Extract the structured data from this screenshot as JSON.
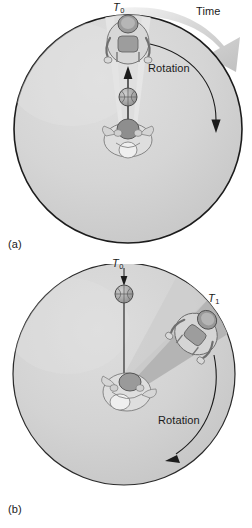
{
  "figure": {
    "caption_a": "(a)",
    "caption_b": "(b)",
    "colors": {
      "disk_fill": "#d2d2d2",
      "disk_edge": "#1c1c1c",
      "wedge_light": "#e3e3e3",
      "wedge_dark": "#b4b4b4",
      "time_arrow": "#c9c9c9",
      "background": "#ffffff",
      "text": "#1a1a1a"
    }
  },
  "panel_a": {
    "label": "(a)",
    "time_label": "Time",
    "rotation_label": "Rotation",
    "t0_label": "T",
    "t0_sub": "0",
    "icons": {
      "thrower": "person-center-throwing-icon",
      "catcher": "person-rim-catching-icon",
      "ball": "basketball-icon",
      "ball_path": "ball-path-arrow-icon",
      "rotation_arc": "rotation-arc-arrow-icon",
      "time_arc": "time-arc-arrow-icon",
      "disk": "rotating-disk-icon",
      "wedge": "light-wedge-sector-icon"
    },
    "geometry": {
      "disk_center_x": 128,
      "disk_center_y": 129,
      "disk_radius": 115,
      "wedge_start_deg": 262,
      "wedge_end_deg": 278
    }
  },
  "panel_b": {
    "label": "(b)",
    "rotation_label": "Rotation",
    "t0_label": "T",
    "t0_sub": "0",
    "t1_label": "T",
    "t1_sub": "1",
    "icons": {
      "thrower": "person-center-throwing-icon",
      "catcher": "person-rim-displaced-icon",
      "ball": "basketball-icon",
      "ball_path": "ball-path-line-icon",
      "rotation_arc": "rotation-arc-arrow-icon",
      "disk": "rotating-disk-icon",
      "wedge_dark": "dark-wedge-sector-icon",
      "wedge_light": "light-wedge-sector-icon"
    },
    "geometry": {
      "disk_center_x": 124,
      "disk_center_y": 110,
      "disk_radius": 112,
      "wedge_dark_start_deg": 298,
      "wedge_dark_end_deg": 326
    }
  }
}
